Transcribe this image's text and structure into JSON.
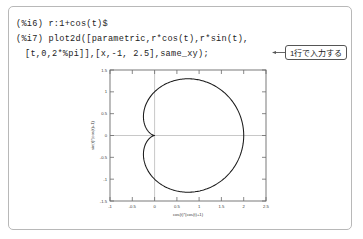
{
  "app": {
    "kind": "maxima-session-figure"
  },
  "console": {
    "lines": [
      {
        "prompt": "(%i6)",
        "text": "(%i6) r:1+cos(t)$"
      },
      {
        "prompt": "(%i7)",
        "text": "(%i7) plot2d([parametric,r*cos(t),r*sin(t),"
      },
      {
        "prompt": "",
        "text": "[t,0,2*%pi]],[x,-1, 2.5],same_xy);"
      }
    ],
    "line1": "(%i6) r:1+cos(t)$",
    "line2": "(%i7) plot2d([parametric,r*cos(t),r*sin(t),",
    "line3": "[t,0,2*%pi]],[x,-1, 2.5],same_xy);"
  },
  "callout": {
    "text": "1行で入力する",
    "arrow_icon": "arrow-left-icon"
  },
  "colors": {
    "panel_border": "#b8b8b8",
    "text": "#232323",
    "plot_frame": "#6b6b6b",
    "curve": "#1a1a1a",
    "zero_axis": "#9a9a9a",
    "callout_border": "#555555"
  },
  "chart_data": {
    "type": "line",
    "title": "",
    "xlabel": "cos(t)*(cos(t)+1)",
    "ylabel": "sin(t)*(cos(t)+1)",
    "xlim": [
      -1,
      2.5
    ],
    "ylim": [
      -1.5,
      1.5
    ],
    "xticks": [
      "-1",
      "-0.5",
      "0",
      "0.5",
      "1",
      "1.5",
      "2",
      "2.5"
    ],
    "xtick_values": [
      -1,
      -0.5,
      0,
      0.5,
      1,
      1.5,
      2,
      2.5
    ],
    "yticks": [
      "1.5",
      "1",
      "0.5",
      "0",
      "-0.5",
      "-1",
      "-1.5"
    ],
    "ytick_values": [
      1.5,
      1,
      0.5,
      0,
      -0.5,
      -1,
      -1.5
    ],
    "grid": false,
    "legend": "none",
    "aspect": "same_xy",
    "series": [
      {
        "name": "cardioid r=1+cos(t)",
        "parametric": true,
        "t_range": [
          0,
          6.283185307179586
        ],
        "formula_x": "(1+cos(t))*cos(t)",
        "formula_y": "(1+cos(t))*sin(t)"
      }
    ]
  }
}
